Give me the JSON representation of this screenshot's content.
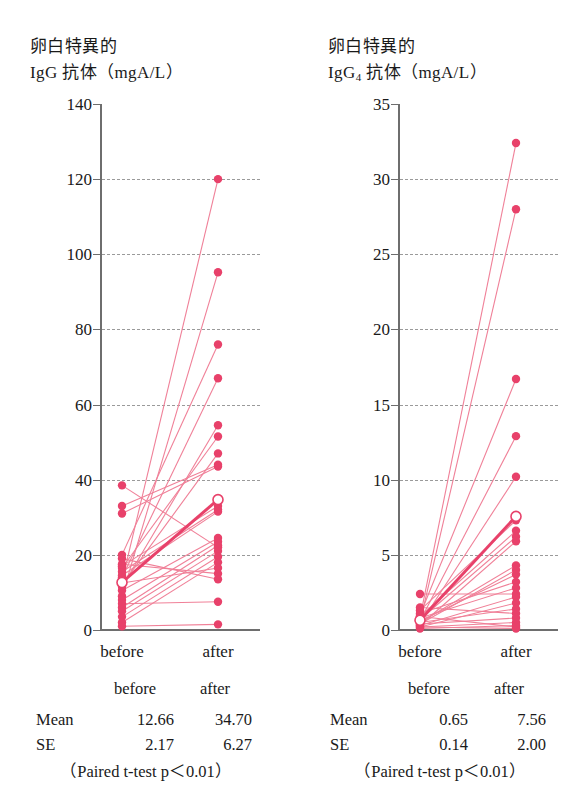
{
  "figure": {
    "panels": [
      {
        "id": "igg",
        "title_line1": "卵白特異的",
        "title_line2_prefix": "IgG",
        "title_line2_sub": "",
        "title_line2_suffix": " 抗体（mgA/L）",
        "stats": {
          "col_before": "before",
          "col_after": "after",
          "mean_label": "Mean",
          "mean_before": "12.66",
          "mean_after": "34.70",
          "se_label": "SE",
          "se_before": "2.17",
          "se_after": "6.27",
          "ptest": "（Paired t-test p＜0.01）"
        }
      },
      {
        "id": "igg4",
        "title_line1": "卵白特異的",
        "title_line2_prefix": "IgG",
        "title_line2_sub": "4",
        "title_line2_suffix": " 抗体（mgA/L）",
        "stats": {
          "col_before": "before",
          "col_after": "after",
          "mean_label": "Mean",
          "mean_before": "0.65",
          "mean_after": "7.56",
          "se_label": "SE",
          "se_before": "0.14",
          "se_after": "2.00",
          "ptest": "（Paired t-test p＜0.01）"
        }
      }
    ]
  },
  "style": {
    "marker_color": "#e8416a",
    "line_color": "#f08098",
    "mean_line_color": "#e8416a",
    "axis_color": "#6e6e6e",
    "grid_color": "#9a9a9a"
  },
  "chart_data": [
    {
      "type": "line",
      "id": "igg",
      "title": "卵白特異的 IgG 抗体（mgA/L）",
      "subtitle": "",
      "xlabel": "",
      "ylabel": "IgG 抗体（mgA/L）",
      "categories": [
        "before",
        "after"
      ],
      "ylim": [
        0,
        140
      ],
      "yticks": [
        0,
        20,
        40,
        60,
        80,
        100,
        120,
        140
      ],
      "grid": true,
      "legend": "none",
      "paired_series": [
        {
          "before": 13.0,
          "after": 120.0
        },
        {
          "before": 9.0,
          "after": 95.2
        },
        {
          "before": 20.0,
          "after": 76.0
        },
        {
          "before": 14.0,
          "after": 67.0
        },
        {
          "before": 11.5,
          "after": 54.5
        },
        {
          "before": 16.5,
          "after": 51.5
        },
        {
          "before": 12.0,
          "after": 47.0
        },
        {
          "before": 33.0,
          "after": 44.0
        },
        {
          "before": 31.0,
          "after": 43.5
        },
        {
          "before": 38.5,
          "after": 22.0
        },
        {
          "before": 17.0,
          "after": 33.0
        },
        {
          "before": 15.5,
          "after": 32.0
        },
        {
          "before": 14.5,
          "after": 31.5
        },
        {
          "before": 10.5,
          "after": 24.5
        },
        {
          "before": 8.0,
          "after": 23.5
        },
        {
          "before": 6.0,
          "after": 22.5
        },
        {
          "before": 5.0,
          "after": 21.0
        },
        {
          "before": 3.5,
          "after": 19.5
        },
        {
          "before": 2.0,
          "after": 18.0
        },
        {
          "before": 12.5,
          "after": 16.5
        },
        {
          "before": 17.5,
          "after": 15.0
        },
        {
          "before": 19.0,
          "after": 13.5
        },
        {
          "before": 7.0,
          "after": 7.5
        },
        {
          "before": 1.0,
          "after": 1.5
        }
      ],
      "mean_series": {
        "before": 12.66,
        "after": 34.7
      },
      "se_series": {
        "before": 2.17,
        "after": 6.27
      },
      "annotation": "（Paired t-test p＜0.01）"
    },
    {
      "type": "line",
      "id": "igg4",
      "title": "卵白特異的 IgG4 抗体（mgA/L）",
      "subtitle": "",
      "xlabel": "",
      "ylabel": "IgG4 抗体（mgA/L）",
      "categories": [
        "before",
        "after"
      ],
      "ylim": [
        0,
        35
      ],
      "yticks": [
        0,
        5,
        10,
        15,
        20,
        25,
        30,
        35
      ],
      "grid": true,
      "legend": "none",
      "paired_series": [
        {
          "before": 0.8,
          "after": 32.4
        },
        {
          "before": 0.5,
          "after": 28.0
        },
        {
          "before": 1.0,
          "after": 16.7
        },
        {
          "before": 0.6,
          "after": 12.9
        },
        {
          "before": 0.4,
          "after": 10.2
        },
        {
          "before": 1.3,
          "after": 7.3
        },
        {
          "before": 0.9,
          "after": 6.6
        },
        {
          "before": 0.7,
          "after": 6.2
        },
        {
          "before": 0.3,
          "after": 5.9
        },
        {
          "before": 0.5,
          "after": 4.3
        },
        {
          "before": 0.4,
          "after": 4.0
        },
        {
          "before": 0.6,
          "after": 3.7
        },
        {
          "before": 2.4,
          "after": 2.4
        },
        {
          "before": 1.1,
          "after": 3.2
        },
        {
          "before": 0.8,
          "after": 2.8
        },
        {
          "before": 0.3,
          "after": 2.2
        },
        {
          "before": 0.2,
          "after": 1.8
        },
        {
          "before": 0.5,
          "after": 1.4
        },
        {
          "before": 1.5,
          "after": 1.1
        },
        {
          "before": 0.4,
          "after": 0.8
        },
        {
          "before": 0.2,
          "after": 0.5
        },
        {
          "before": 0.1,
          "after": 0.3
        },
        {
          "before": 0.9,
          "after": 0.2
        },
        {
          "before": 0.2,
          "after": 0.1
        }
      ],
      "mean_series": {
        "before": 0.65,
        "after": 7.56
      },
      "se_series": {
        "before": 0.14,
        "after": 2.0
      },
      "annotation": "（Paired t-test p＜0.01）"
    }
  ]
}
